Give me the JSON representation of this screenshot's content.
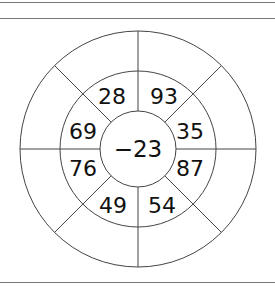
{
  "puzzle": {
    "center": "−23",
    "inner_ring": [
      {
        "position": "top-left",
        "value": "28"
      },
      {
        "position": "top-right",
        "value": "93"
      },
      {
        "position": "right-upper",
        "value": "35"
      },
      {
        "position": "right-lower",
        "value": "87"
      },
      {
        "position": "bottom-right",
        "value": "54"
      },
      {
        "position": "bottom-left",
        "value": "49"
      },
      {
        "position": "left-lower",
        "value": "76"
      },
      {
        "position": "left-upper",
        "value": "69"
      }
    ],
    "outer_ring": [
      "",
      "",
      "",
      "",
      "",
      "",
      "",
      ""
    ]
  }
}
